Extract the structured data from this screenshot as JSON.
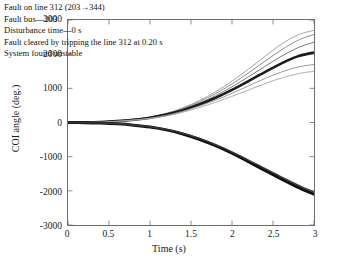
{
  "chart_data": {
    "type": "line",
    "title": "",
    "xlabel": "Time (s)",
    "ylabel": "COI angle (deg.)",
    "xlim": [
      0,
      3
    ],
    "ylim": [
      -3000,
      3000
    ],
    "xticks": [
      "0",
      "0.5",
      "1",
      "1.5",
      "2",
      "2.5",
      "3"
    ],
    "xtick_values": [
      0,
      0.5,
      1,
      1.5,
      2,
      2.5,
      3
    ],
    "yticks": [
      "3000",
      "2000",
      "1000",
      "0",
      "-1000",
      "-2000",
      "-3000"
    ],
    "ytick_values": [
      3000,
      2000,
      1000,
      0,
      -1000,
      -2000,
      -3000
    ],
    "grid": false,
    "legend_position": "none",
    "x": [
      0,
      0.2,
      0.4,
      0.6,
      0.8,
      1.0,
      1.2,
      1.4,
      1.6,
      1.8,
      2.0,
      2.2,
      2.4,
      2.6,
      2.8,
      3.0
    ],
    "series": [
      {
        "name": "unstable-group-upper-1",
        "color": "#9a9a9a",
        "width": 0.9,
        "values": [
          0,
          5,
          20,
          50,
          95,
          160,
          270,
          430,
          640,
          900,
          1210,
          1560,
          1930,
          2290,
          2560,
          2700
        ]
      },
      {
        "name": "unstable-group-upper-2",
        "color": "#808080",
        "width": 0.9,
        "values": [
          0,
          5,
          20,
          48,
          92,
          155,
          258,
          408,
          605,
          845,
          1130,
          1450,
          1790,
          2120,
          2400,
          2580
        ]
      },
      {
        "name": "unstable-group-upper-3",
        "color": "#6b6b6b",
        "width": 0.9,
        "values": [
          0,
          4,
          18,
          45,
          88,
          148,
          245,
          385,
          565,
          785,
          1045,
          1335,
          1640,
          1935,
          2185,
          2350
        ]
      },
      {
        "name": "unstable-group-upper-thick",
        "color": "#1c1c1c",
        "width": 2.6,
        "values": [
          0,
          4,
          16,
          42,
          82,
          140,
          230,
          360,
          525,
          725,
          955,
          1210,
          1475,
          1725,
          1935,
          2050
        ]
      },
      {
        "name": "unstable-group-upper-4",
        "color": "#8f8f8f",
        "width": 0.9,
        "values": [
          0,
          4,
          15,
          38,
          75,
          128,
          212,
          330,
          480,
          655,
          855,
          1070,
          1285,
          1475,
          1620,
          1700
        ]
      },
      {
        "name": "unstable-group-upper-5",
        "color": "#a8a8a8",
        "width": 0.9,
        "values": [
          0,
          3,
          13,
          34,
          68,
          116,
          192,
          300,
          435,
          590,
          765,
          950,
          1135,
          1300,
          1425,
          1500
        ]
      },
      {
        "name": "unstable-group-lower-thick",
        "color": "#111111",
        "width": 3.0,
        "values": [
          0,
          -4,
          -16,
          -40,
          -78,
          -132,
          -215,
          -335,
          -490,
          -680,
          -900,
          -1145,
          -1400,
          -1650,
          -1890,
          -2100
        ]
      },
      {
        "name": "unstable-group-lower-2",
        "color": "#3a3a3a",
        "width": 1.4,
        "values": [
          0,
          -4,
          -15,
          -37,
          -73,
          -124,
          -203,
          -317,
          -466,
          -650,
          -862,
          -1098,
          -1345,
          -1590,
          -1825,
          -2035
        ]
      }
    ],
    "annotation_lines": [
      "Fault on line 312 (203→344)",
      "Fault bus—203",
      "Disturbance time—0 s",
      "Fault cleared by tripping the line 312 at 0.20 s",
      "System found unstable"
    ]
  },
  "axes": {
    "x_title": "Time (s)",
    "y_title": "COI angle (deg.)"
  }
}
